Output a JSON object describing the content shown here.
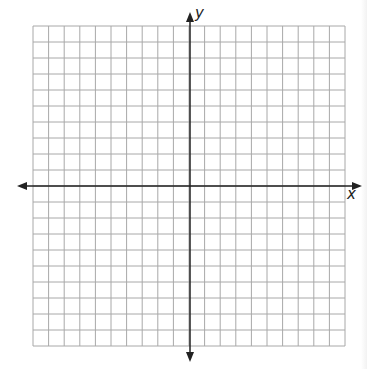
{
  "diagram": {
    "type": "coordinate-plane",
    "grid": {
      "columns": 20,
      "rows": 20,
      "left": 33,
      "top": 26,
      "right": 345,
      "bottom": 346,
      "line_color": "#a8a8a8"
    },
    "axes": {
      "origin_x": 190,
      "origin_y": 186,
      "color": "#222222",
      "x_axis": {
        "from": 17,
        "to": 362,
        "label": "x"
      },
      "y_axis": {
        "from": 12,
        "to": 362,
        "label": "y"
      }
    }
  }
}
